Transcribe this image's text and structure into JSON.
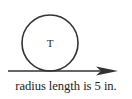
{
  "figure": {
    "caption": "radius length is 5 in.",
    "wheel_label": "T",
    "colors": {
      "stroke": "#333333",
      "text": "#1c1c1c",
      "background": "#ffffff"
    },
    "geometry": {
      "circle_center_x": 50,
      "circle_center_y": 43,
      "circle_radius": 28,
      "ground_line_y": 71,
      "ground_line_x_start": 8,
      "arrow_tip_x": 118
    },
    "measurements": {
      "radius_value": "5",
      "radius_unit": "in."
    }
  }
}
